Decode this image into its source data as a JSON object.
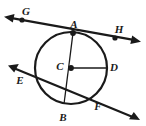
{
  "figure": {
    "kind": "circle-geometry-diagram",
    "width": 146,
    "height": 126,
    "background_color": "#ffffff",
    "stroke_color": "#1a1a1a",
    "labels": {
      "G": "G",
      "A": "A",
      "H": "H",
      "E": "E",
      "C": "C",
      "D": "D",
      "B": "B",
      "F": "F"
    },
    "label_positions": {
      "G": {
        "x": 26,
        "y": 11
      },
      "A": {
        "x": 74,
        "y": 24
      },
      "H": {
        "x": 119,
        "y": 29
      },
      "E": {
        "x": 20,
        "y": 80
      },
      "C": {
        "x": 60,
        "y": 66
      },
      "D": {
        "x": 114,
        "y": 67
      },
      "B": {
        "x": 63,
        "y": 117
      },
      "F": {
        "x": 98,
        "y": 106
      }
    },
    "circle": {
      "center_x": 71,
      "center_y": 68,
      "radius": 36,
      "stroke_width": 2.2
    },
    "points": [
      {
        "name": "G",
        "x": 22,
        "y": 20,
        "on": "tangent-line",
        "dot": true
      },
      {
        "name": "A",
        "x": 73,
        "y": 33,
        "on": "circle",
        "dot": true
      },
      {
        "name": "H",
        "x": 115,
        "y": 38,
        "on": "tangent-line",
        "dot": true
      },
      {
        "name": "C",
        "x": 71,
        "y": 68,
        "on": "center",
        "dot": true
      },
      {
        "name": "D",
        "x": 107,
        "y": 68,
        "on": "circle",
        "dot": false
      },
      {
        "name": "B",
        "x": 64,
        "y": 104,
        "on": "circle",
        "dot": false
      },
      {
        "name": "E",
        "x": 36,
        "y": 74,
        "on": "circle",
        "dot": false
      },
      {
        "name": "F",
        "x": 95,
        "y": 97,
        "on": "circle",
        "dot": false
      }
    ],
    "segments": [
      {
        "name": "tangent-line-GH",
        "x1": 5,
        "y1": 17,
        "x2": 140,
        "y2": 41,
        "arrows": "both",
        "stroke_width": 2.2
      },
      {
        "name": "secant-line-EF",
        "x1": 9,
        "y1": 66,
        "x2": 140,
        "y2": 120,
        "arrows": "both",
        "stroke_width": 2.2
      },
      {
        "name": "diameter-AB",
        "x1": 73,
        "y1": 33,
        "x2": 64,
        "y2": 104,
        "arrows": "none",
        "stroke_width": 1.3
      },
      {
        "name": "radius-CD",
        "x1": 71,
        "y1": 68,
        "x2": 107,
        "y2": 68,
        "arrows": "none",
        "stroke_width": 1.3
      }
    ]
  }
}
